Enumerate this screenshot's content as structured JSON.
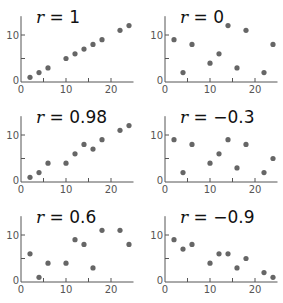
{
  "chart_data": [
    {
      "type": "scatter",
      "title": "r = 1",
      "label_var": "r",
      "label_value": "1",
      "x": [
        2,
        4,
        6,
        10,
        12,
        14,
        16,
        18,
        22,
        24
      ],
      "y": [
        1,
        2,
        3,
        5,
        6,
        7,
        8,
        9,
        11,
        12
      ],
      "xlim": [
        0,
        25
      ],
      "ylim": [
        0,
        14
      ],
      "xticks": [
        0,
        5,
        10,
        15,
        20
      ],
      "xticklabels": [
        "0",
        "10",
        "20"
      ],
      "yticks": [
        0,
        5,
        10
      ],
      "yticklabels": [
        "0",
        "10"
      ],
      "grid": false
    },
    {
      "type": "scatter",
      "title": "r = 0",
      "label_var": "r",
      "label_value": "0",
      "x": [
        2,
        4,
        6,
        10,
        12,
        14,
        16,
        18,
        22,
        24
      ],
      "y": [
        9,
        2,
        8,
        4,
        6,
        12,
        3,
        11,
        2,
        8
      ],
      "xlim": [
        0,
        25
      ],
      "ylim": [
        0,
        14
      ],
      "xticks": [
        0,
        5,
        10,
        15,
        20
      ],
      "xticklabels": [
        "0",
        "10",
        "20"
      ],
      "yticks": [
        0,
        5,
        10
      ],
      "yticklabels": [
        "0",
        "10"
      ],
      "grid": false
    },
    {
      "type": "scatter",
      "title": "r = 0.98",
      "label_var": "r",
      "label_value": "0.98",
      "x": [
        2,
        4,
        6,
        10,
        12,
        14,
        16,
        18,
        22,
        24
      ],
      "y": [
        1,
        2,
        4,
        4,
        6,
        8,
        7,
        9,
        11,
        12
      ],
      "xlim": [
        0,
        25
      ],
      "ylim": [
        0,
        14
      ],
      "xticks": [
        0,
        5,
        10,
        15,
        20
      ],
      "xticklabels": [
        "0",
        "10",
        "20"
      ],
      "yticks": [
        0,
        5,
        10
      ],
      "yticklabels": [
        "0",
        "10"
      ],
      "grid": false
    },
    {
      "type": "scatter",
      "title": "r = −0.3",
      "label_var": "r",
      "label_value": "−0.3",
      "x": [
        2,
        4,
        6,
        10,
        12,
        14,
        16,
        18,
        22,
        24
      ],
      "y": [
        9,
        2,
        8,
        4,
        6,
        9,
        3,
        8,
        2,
        5
      ],
      "xlim": [
        0,
        25
      ],
      "ylim": [
        0,
        14
      ],
      "xticks": [
        0,
        5,
        10,
        15,
        20
      ],
      "xticklabels": [
        "0",
        "10",
        "20"
      ],
      "yticks": [
        0,
        5,
        10
      ],
      "yticklabels": [
        "0",
        "10"
      ],
      "grid": false
    },
    {
      "type": "scatter",
      "title": "r = 0.6",
      "label_var": "r",
      "label_value": "0.6",
      "x": [
        2,
        4,
        6,
        10,
        12,
        14,
        16,
        18,
        22,
        24
      ],
      "y": [
        6,
        1,
        4,
        4,
        9,
        8,
        3,
        11,
        11,
        8
      ],
      "xlim": [
        0,
        25
      ],
      "ylim": [
        0,
        14
      ],
      "xticks": [
        0,
        5,
        10,
        15,
        20
      ],
      "xticklabels": [
        "0",
        "10",
        "20"
      ],
      "yticks": [
        0,
        5,
        10
      ],
      "yticklabels": [
        "0",
        "10"
      ],
      "grid": false
    },
    {
      "type": "scatter",
      "title": "r = −0.9",
      "label_var": "r",
      "label_value": "−0.9",
      "x": [
        2,
        4,
        6,
        10,
        12,
        14,
        16,
        18,
        22,
        24
      ],
      "y": [
        9,
        7,
        8,
        4,
        6,
        6,
        3,
        5,
        2,
        1
      ],
      "xlim": [
        0,
        25
      ],
      "ylim": [
        0,
        14
      ],
      "xticks": [
        0,
        5,
        10,
        15,
        20
      ],
      "xticklabels": [
        "0",
        "10",
        "20"
      ],
      "yticks": [
        0,
        5,
        10
      ],
      "yticklabels": [
        "0",
        "10"
      ],
      "grid": false
    }
  ],
  "layout": {
    "columns": 2,
    "panel_origins": [
      [
        21,
        82
      ],
      [
        165,
        82
      ],
      [
        21,
        182
      ],
      [
        165,
        182
      ],
      [
        21,
        282
      ],
      [
        165,
        282
      ]
    ],
    "px_per_x": 4.5,
    "px_per_y": 4.7,
    "colors": {
      "axis": "#555555",
      "dot": "#666666",
      "label": "#111111"
    }
  }
}
